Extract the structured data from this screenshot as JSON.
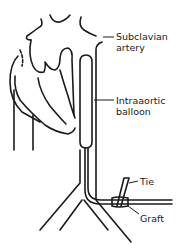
{
  "figure": {
    "stroke_color": "#1a1a1a",
    "background": "#ffffff"
  },
  "labels": {
    "subclavian_line1": "Subclavian",
    "subclavian_line2": "artery",
    "balloon_line1": "Intraaortic",
    "balloon_line2": "balloon",
    "tie": "Tie",
    "graft": "Graft"
  }
}
